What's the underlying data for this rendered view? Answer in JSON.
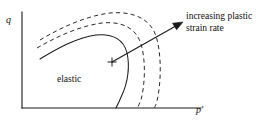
{
  "figure": {
    "kind": "yield-surface-diagram",
    "background_color": "#ffffff",
    "ink_color": "#1a1a1a",
    "axes": {
      "y_axis_label": "q",
      "x_axis_label": "p'",
      "origin_px": [
        22,
        108
      ],
      "y_axis_top_px": [
        22,
        12
      ],
      "x_axis_right_px": [
        201,
        108
      ]
    },
    "region_label": "elastic",
    "annotation": {
      "line1": "increasing plastic",
      "line2": "strain rate"
    },
    "marker": {
      "name": "stress-state-plus-marker",
      "x_px": 112,
      "y_px": 62,
      "size_px": 9
    },
    "arrow": {
      "name": "increasing-plastic-strain-rate-arrow",
      "start_px": [
        112,
        62
      ],
      "end_px": [
        183,
        22
      ]
    },
    "curves": [
      {
        "name": "yield-locus-solid",
        "style": "solid",
        "path": "M 40,59 C 58,48 76,38 96,35 C 113,33 124,40 127,53 C 130,66 128,82 122,95 C 119,102 117,106 116,108"
      },
      {
        "name": "yield-locus-dashed-inner",
        "style": "dashed",
        "path": "M 37,48 C 58,36 80,26 102,23 C 122,21 136,28 141,44 C 146,61 145,84 141,100 C 139,105 138,107 137,108"
      },
      {
        "name": "yield-locus-dashed-outer",
        "style": "dashed",
        "path": "M 40,40 C 62,27 86,16 110,13 C 132,11 150,18 156,36 C 162,55 161,84 157,101 C 156,105 155,107 154,108"
      }
    ]
  }
}
